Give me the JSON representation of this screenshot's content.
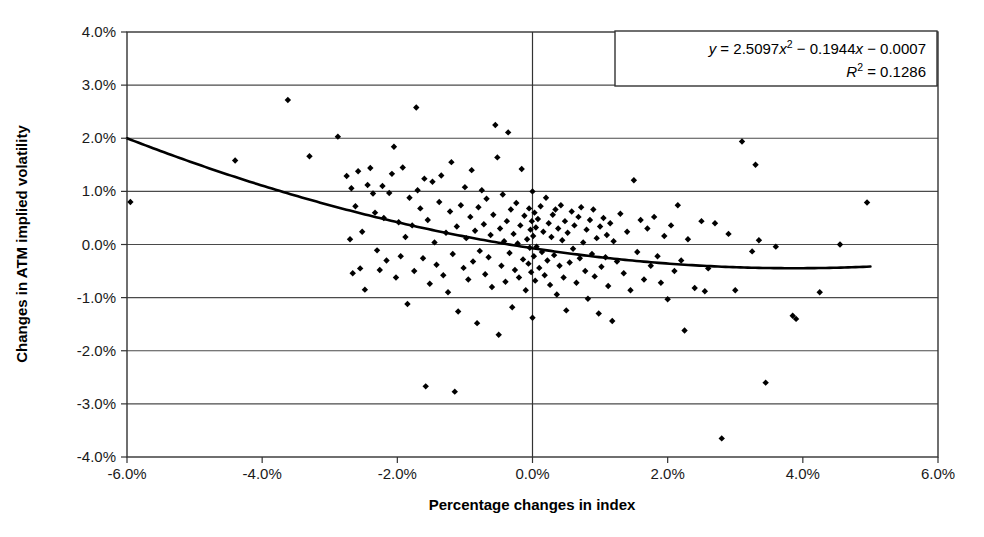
{
  "chart_data": {
    "type": "scatter",
    "title": "",
    "xlabel": "Percentage changes in index",
    "ylabel": "Changes in ATM implied volatility",
    "xlim": [
      -6.0,
      6.0
    ],
    "ylim": [
      -4.0,
      4.0
    ],
    "xticks": [
      "-6.0%",
      "-4.0%",
      "-2.0%",
      "0.0%",
      "2.0%",
      "4.0%",
      "6.0%"
    ],
    "xtick_values": [
      -6.0,
      -4.0,
      -2.0,
      0.0,
      2.0,
      4.0,
      6.0
    ],
    "yticks": [
      "4.0%",
      "3.0%",
      "2.0%",
      "1.0%",
      "0.0%",
      "-1.0%",
      "-2.0%",
      "-3.0%",
      "-4.0%"
    ],
    "ytick_values": [
      4.0,
      3.0,
      2.0,
      1.0,
      0.0,
      -1.0,
      -2.0,
      -3.0,
      -4.0
    ],
    "grid": true,
    "grid_axis": "y",
    "legend": false,
    "zero_line_x": 0.0,
    "marker": "diamond",
    "marker_color": "#000000",
    "trendline": {
      "type": "polynomial",
      "order": 2,
      "equation": "y = 2.5097x² − 0.1944x − 0.0007",
      "equation_parts": {
        "y": "y",
        "eq1": " = 2.5097",
        "x1": "x",
        "sup1": "2",
        "mid": " − 0.1944",
        "x2": "x",
        "tail": " − 0.0007"
      },
      "r_squared_label": "R",
      "r_squared_sup": "2",
      "r_squared_value": " = 0.1286",
      "r_squared": 0.1286,
      "coefficients": {
        "a": 2.5097,
        "b": -0.1944,
        "c": -0.0007
      },
      "color": "#000000",
      "x_start": -6.0,
      "x_end": 5.0
    },
    "points": [
      [
        -5.95,
        0.8
      ],
      [
        -4.4,
        1.58
      ],
      [
        -3.62,
        2.72
      ],
      [
        -3.3,
        1.66
      ],
      [
        -2.88,
        2.03
      ],
      [
        -2.75,
        1.29
      ],
      [
        -2.7,
        0.1
      ],
      [
        -2.68,
        1.06
      ],
      [
        -2.66,
        -0.54
      ],
      [
        -2.62,
        0.72
      ],
      [
        -2.58,
        1.38
      ],
      [
        -2.55,
        -0.45
      ],
      [
        -2.52,
        0.24
      ],
      [
        -2.48,
        -0.85
      ],
      [
        -2.44,
        1.12
      ],
      [
        -2.4,
        1.44
      ],
      [
        -2.36,
        0.96
      ],
      [
        -2.33,
        0.6
      ],
      [
        -2.3,
        -0.11
      ],
      [
        -2.26,
        -0.48
      ],
      [
        -2.22,
        1.1
      ],
      [
        -2.2,
        0.5
      ],
      [
        -2.16,
        -0.3
      ],
      [
        -2.12,
        0.97
      ],
      [
        -2.08,
        1.33
      ],
      [
        -2.05,
        1.84
      ],
      [
        -2.02,
        -0.62
      ],
      [
        -1.98,
        0.42
      ],
      [
        -1.95,
        -0.22
      ],
      [
        -1.92,
        1.45
      ],
      [
        -1.88,
        0.14
      ],
      [
        -1.85,
        -1.12
      ],
      [
        -1.82,
        0.88
      ],
      [
        -1.78,
        0.36
      ],
      [
        -1.75,
        -0.5
      ],
      [
        -1.72,
        2.58
      ],
      [
        -1.7,
        1.02
      ],
      [
        -1.66,
        0.68
      ],
      [
        -1.62,
        -0.26
      ],
      [
        -1.6,
        1.24
      ],
      [
        -1.58,
        -2.67
      ],
      [
        -1.55,
        0.46
      ],
      [
        -1.52,
        -0.74
      ],
      [
        -1.48,
        1.18
      ],
      [
        -1.45,
        0.04
      ],
      [
        -1.42,
        -0.38
      ],
      [
        -1.38,
        0.8
      ],
      [
        -1.35,
        1.3
      ],
      [
        -1.32,
        -0.58
      ],
      [
        -1.28,
        0.22
      ],
      [
        -1.25,
        -0.9
      ],
      [
        -1.22,
        0.62
      ],
      [
        -1.2,
        1.55
      ],
      [
        -1.18,
        -0.18
      ],
      [
        -1.15,
        -2.77
      ],
      [
        -1.12,
        0.34
      ],
      [
        -1.1,
        -1.26
      ],
      [
        -1.06,
        0.74
      ],
      [
        -1.02,
        -0.44
      ],
      [
        -1.0,
        1.08
      ],
      [
        -0.98,
        0.12
      ],
      [
        -0.95,
        -0.66
      ],
      [
        -0.92,
        0.52
      ],
      [
        -0.9,
        1.4
      ],
      [
        -0.88,
        -0.32
      ],
      [
        -0.85,
        0.26
      ],
      [
        -0.82,
        -1.48
      ],
      [
        -0.8,
        0.7
      ],
      [
        -0.78,
        -0.12
      ],
      [
        -0.75,
        1.02
      ],
      [
        -0.72,
        0.38
      ],
      [
        -0.7,
        -0.56
      ],
      [
        -0.68,
        0.86
      ],
      [
        -0.65,
        -0.24
      ],
      [
        -0.62,
        0.18
      ],
      [
        -0.6,
        -0.8
      ],
      [
        -0.58,
        0.56
      ],
      [
        -0.55,
        2.25
      ],
      [
        -0.52,
        1.64
      ],
      [
        -0.5,
        -1.7
      ],
      [
        -0.48,
        0.3
      ],
      [
        -0.46,
        -0.4
      ],
      [
        -0.44,
        0.94
      ],
      [
        -0.42,
        0.06
      ],
      [
        -0.4,
        -0.7
      ],
      [
        -0.38,
        0.44
      ],
      [
        -0.36,
        2.11
      ],
      [
        -0.34,
        -0.16
      ],
      [
        -0.32,
        0.66
      ],
      [
        -0.3,
        -1.18
      ],
      [
        -0.28,
        0.2
      ],
      [
        -0.26,
        -0.48
      ],
      [
        -0.24,
        0.78
      ],
      [
        -0.22,
        0.02
      ],
      [
        -0.2,
        -0.62
      ],
      [
        -0.18,
        0.36
      ],
      [
        -0.16,
        1.42
      ],
      [
        -0.14,
        -0.28
      ],
      [
        -0.12,
        0.54
      ],
      [
        -0.1,
        -0.86
      ],
      [
        -0.08,
        0.1
      ],
      [
        -0.06,
        -0.36
      ],
      [
        -0.05,
        0.68
      ],
      [
        -0.04,
        -0.06
      ],
      [
        -0.03,
        0.28
      ],
      [
        -0.02,
        -0.52
      ],
      [
        -0.01,
        0.44
      ],
      [
        0.0,
        1.0
      ],
      [
        0.0,
        -1.38
      ],
      [
        0.01,
        0.16
      ],
      [
        0.02,
        -0.22
      ],
      [
        0.03,
        0.6
      ],
      [
        0.04,
        -0.68
      ],
      [
        0.05,
        0.32
      ],
      [
        0.06,
        -0.04
      ],
      [
        0.08,
        0.48
      ],
      [
        0.1,
        -0.44
      ],
      [
        0.12,
        0.72
      ],
      [
        0.14,
        -0.14
      ],
      [
        0.16,
        0.24
      ],
      [
        0.18,
        -0.58
      ],
      [
        0.2,
        0.88
      ],
      [
        0.22,
        -0.3
      ],
      [
        0.24,
        0.4
      ],
      [
        0.26,
        -0.76
      ],
      [
        0.28,
        0.14
      ],
      [
        0.3,
        0.56
      ],
      [
        0.32,
        -0.2
      ],
      [
        0.34,
        0.66
      ],
      [
        0.36,
        -0.94
      ],
      [
        0.38,
        0.3
      ],
      [
        0.4,
        -0.4
      ],
      [
        0.42,
        0.74
      ],
      [
        0.44,
        0.08
      ],
      [
        0.46,
        -0.62
      ],
      [
        0.48,
        0.44
      ],
      [
        0.5,
        -1.24
      ],
      [
        0.52,
        0.22
      ],
      [
        0.55,
        -0.34
      ],
      [
        0.58,
        0.62
      ],
      [
        0.6,
        -0.08
      ],
      [
        0.62,
        0.36
      ],
      [
        0.65,
        -0.72
      ],
      [
        0.68,
        0.52
      ],
      [
        0.7,
        -0.26
      ],
      [
        0.72,
        0.7
      ],
      [
        0.75,
        0.04
      ],
      [
        0.78,
        -0.5
      ],
      [
        0.8,
        0.28
      ],
      [
        0.82,
        -1.02
      ],
      [
        0.85,
        0.46
      ],
      [
        0.88,
        -0.18
      ],
      [
        0.9,
        0.66
      ],
      [
        0.92,
        -0.6
      ],
      [
        0.95,
        0.12
      ],
      [
        0.98,
        -1.3
      ],
      [
        1.0,
        0.34
      ],
      [
        1.02,
        -0.42
      ],
      [
        1.05,
        0.5
      ],
      [
        1.08,
        -0.24
      ],
      [
        1.1,
        0.18
      ],
      [
        1.12,
        -0.78
      ],
      [
        1.15,
        0.4
      ],
      [
        1.18,
        -1.44
      ],
      [
        1.2,
        0.06
      ],
      [
        1.25,
        -0.32
      ],
      [
        1.3,
        0.58
      ],
      [
        1.35,
        -0.54
      ],
      [
        1.4,
        0.24
      ],
      [
        1.45,
        -0.86
      ],
      [
        1.5,
        1.21
      ],
      [
        1.55,
        -0.14
      ],
      [
        1.6,
        0.46
      ],
      [
        1.65,
        -0.66
      ],
      [
        1.7,
        0.3
      ],
      [
        1.75,
        -0.4
      ],
      [
        1.8,
        0.52
      ],
      [
        1.85,
        -0.22
      ],
      [
        1.9,
        -0.72
      ],
      [
        1.95,
        0.16
      ],
      [
        2.0,
        -1.03
      ],
      [
        2.05,
        0.36
      ],
      [
        2.1,
        -0.5
      ],
      [
        2.15,
        0.74
      ],
      [
        2.2,
        -0.3
      ],
      [
        2.25,
        -1.62
      ],
      [
        2.3,
        0.1
      ],
      [
        2.4,
        -0.82
      ],
      [
        2.5,
        0.44
      ],
      [
        2.55,
        -0.88
      ],
      [
        2.6,
        -0.45
      ],
      [
        2.7,
        0.4
      ],
      [
        2.8,
        -3.65
      ],
      [
        2.9,
        0.2
      ],
      [
        3.0,
        -0.86
      ],
      [
        3.1,
        1.94
      ],
      [
        3.25,
        -0.13
      ],
      [
        3.3,
        1.5
      ],
      [
        3.35,
        0.08
      ],
      [
        3.45,
        -2.6
      ],
      [
        3.6,
        -0.04
      ],
      [
        3.85,
        -1.34
      ],
      [
        3.9,
        -1.4
      ],
      [
        4.25,
        -0.9
      ],
      [
        4.55,
        0.0
      ],
      [
        4.95,
        0.79
      ]
    ]
  },
  "equation_box": {
    "line1_y": "y",
    "line1_rest": " = 2.5097",
    "line1_x": "x",
    "line1_sup": "2",
    "line1_mid": " − 0.1944",
    "line1_x2": "x",
    "line1_tail": " − 0.0007",
    "line2_r": "R",
    "line2_sup": "2",
    "line2_rest": " = 0.1286"
  }
}
